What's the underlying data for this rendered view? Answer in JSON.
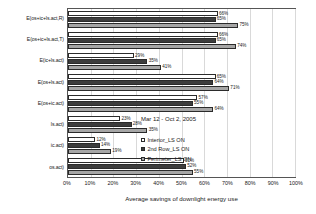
{
  "chart_data": {
    "type": "bar",
    "orientation": "horizontal",
    "title": "",
    "xlabel": "Average savings of downlight energy use",
    "ylabel": "",
    "xlim": [
      0,
      100
    ],
    "xunit": "%",
    "grid": true,
    "legend_position": "inside-lower-right",
    "annotation": "Mar 12 - Oct 2, 2005",
    "xticks": [
      "0%",
      "10%",
      "20%",
      "30%",
      "40%",
      "50%",
      "60%",
      "70%",
      "80%",
      "90%",
      "100%"
    ],
    "xtick_values": [
      0,
      10,
      20,
      30,
      40,
      50,
      60,
      70,
      80,
      90,
      100
    ],
    "categories": [
      "E(os+ic+ls.act,R)",
      "E(os+ic+ls.act,T)",
      "E(ic+ls.act)",
      "E(os+ls.act)",
      "E(os+ic.act)",
      "ls.act)",
      "ic.act)",
      "os.act)"
    ],
    "series": [
      {
        "name": "Interior_LS ON",
        "color": "#ffffff",
        "values": [
          66,
          66,
          29,
          65,
          57,
          23,
          12,
          51
        ],
        "labels": [
          "66%",
          "66%",
          "29%",
          "65%",
          "57%",
          "23%",
          "12%",
          "51%"
        ]
      },
      {
        "name": "2nd Row_LS ON",
        "color": "#3d3d3d",
        "values": [
          65,
          65,
          35,
          64,
          55,
          28,
          14,
          52
        ],
        "labels": [
          "65%",
          "65%",
          "35%",
          "64%",
          "55%",
          "28%",
          "14%",
          "52%"
        ]
      },
      {
        "name": "Perimeter_LS ON",
        "color": "#a6a6a6",
        "values": [
          75,
          74,
          41,
          71,
          64,
          35,
          19,
          55
        ],
        "labels": [
          "75%",
          "74%",
          "41%",
          "71%",
          "64%",
          "35%",
          "19%",
          "55%"
        ]
      }
    ]
  }
}
